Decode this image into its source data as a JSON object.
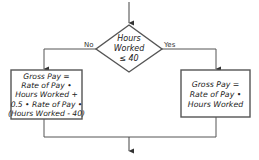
{
  "diagram": {
    "type": "flowchart",
    "decision": {
      "lines": [
        "Hours",
        "Worked",
        "≤ 40"
      ]
    },
    "branches": {
      "no_label": "No",
      "yes_label": "Yes"
    },
    "no_box": {
      "lines": [
        "Gross Pay =",
        "Rate of Pay •",
        "Hours Worked +",
        "0.5 • Rate of Pay •",
        "(Hours Worked - 40)"
      ]
    },
    "yes_box": {
      "lines": [
        "Gross Pay =",
        "Rate of Pay •",
        "Hours Worked"
      ]
    },
    "colors": {
      "stroke": "#555555",
      "text": "#222222",
      "background": "#ffffff"
    }
  }
}
